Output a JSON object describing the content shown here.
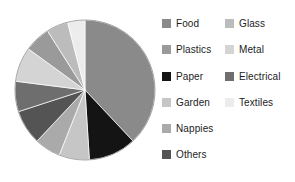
{
  "chart_data": {
    "type": "pie",
    "title": "",
    "subtitle": "",
    "xlabel": "",
    "ylabel": "",
    "legend_position": "right",
    "grid": false,
    "start_angle_deg": 0,
    "direction": "clockwise",
    "categories": [
      "Food",
      "Paper",
      "Garden",
      "Nappies",
      "Others",
      "Electrical",
      "Metal",
      "Plastics",
      "Glass",
      "Textiles"
    ],
    "values": [
      38,
      11,
      7,
      6,
      8,
      7,
      8,
      6,
      5,
      4
    ],
    "colors": [
      "#8a8a8a",
      "#141414",
      "#c6c6c6",
      "#aaaaaa",
      "#545454",
      "#6e6e6e",
      "#d4d4d4",
      "#9a9a9a",
      "#bcbcbc",
      "#ececec"
    ],
    "slices": [
      {
        "label": "Food",
        "value": 38,
        "color": "#8a8a8a"
      },
      {
        "label": "Paper",
        "value": 11,
        "color": "#141414"
      },
      {
        "label": "Garden",
        "value": 7,
        "color": "#c6c6c6"
      },
      {
        "label": "Nappies",
        "value": 6,
        "color": "#aaaaaa"
      },
      {
        "label": "Others",
        "value": 8,
        "color": "#545454"
      },
      {
        "label": "Electrical",
        "value": 7,
        "color": "#6e6e6e"
      },
      {
        "label": "Metal",
        "value": 8,
        "color": "#d4d4d4"
      },
      {
        "label": "Plastics",
        "value": 6,
        "color": "#9a9a9a"
      },
      {
        "label": "Glass",
        "value": 5,
        "color": "#bcbcbc"
      },
      {
        "label": "Textiles",
        "value": 4,
        "color": "#ececec"
      }
    ]
  },
  "legend": {
    "left_column": [
      {
        "label": "Food",
        "color": "#8a8a8a"
      },
      {
        "label": "Plastics",
        "color": "#9a9a9a"
      },
      {
        "label": "Paper",
        "color": "#141414"
      },
      {
        "label": "Garden",
        "color": "#c6c6c6"
      },
      {
        "label": "Nappies",
        "color": "#aaaaaa"
      },
      {
        "label": "Others",
        "color": "#545454"
      }
    ],
    "right_column": [
      {
        "label": "Glass",
        "color": "#bcbcbc"
      },
      {
        "label": "Metal",
        "color": "#d4d4d4"
      },
      {
        "label": "Electrical",
        "color": "#6e6e6e"
      },
      {
        "label": "Textiles",
        "color": "#ececec"
      }
    ]
  },
  "pie_geometry": {
    "center_x": 73,
    "center_y": 78,
    "radius": 70,
    "outline_color": "#8f8f8f"
  }
}
